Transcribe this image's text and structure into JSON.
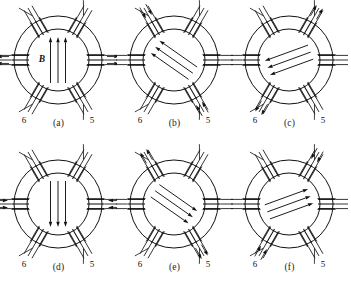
{
  "figure": {
    "background_color": "#ffffff",
    "line_color": "#111111",
    "panel_count": 6,
    "terminal_labels": [
      "1",
      "2",
      "3",
      "4",
      "5",
      "6"
    ],
    "field_label": "B"
  },
  "geometry": {
    "outer_radius": 44,
    "inner_radius": 31,
    "center_x": 58,
    "center_y": 60,
    "coil_angles_deg": [
      180,
      240,
      300,
      0,
      60,
      120
    ],
    "terminal_label_text": [
      "1",
      "2",
      "3",
      "4",
      "5",
      "6"
    ]
  },
  "panels": [
    {
      "id": "a",
      "caption": "(a)",
      "field_angle_deg": 270,
      "field_label": "B",
      "field_label_visible": true,
      "arrow_count": 3,
      "active_terminals": [
        "1",
        "4"
      ],
      "terminals": [
        {
          "label": "1",
          "angle_deg": 180,
          "lead_arrows": "out"
        },
        {
          "label": "2",
          "angle_deg": 240,
          "lead_arrows": "none"
        },
        {
          "label": "3",
          "angle_deg": 300,
          "lead_arrows": "none"
        },
        {
          "label": "4",
          "angle_deg": 0,
          "lead_arrows": "out"
        },
        {
          "label": "5",
          "angle_deg": 60,
          "lead_arrows": "none"
        },
        {
          "label": "6",
          "angle_deg": 120,
          "lead_arrows": "none"
        }
      ]
    },
    {
      "id": "b",
      "caption": "(b)",
      "field_angle_deg": 215,
      "field_label": "B",
      "field_label_visible": false,
      "arrow_count": 3,
      "active_terminals": [
        "2",
        "5"
      ],
      "terminals": [
        {
          "label": "1",
          "angle_deg": 180,
          "lead_arrows": "none"
        },
        {
          "label": "2",
          "angle_deg": 240,
          "lead_arrows": "in"
        },
        {
          "label": "3",
          "angle_deg": 300,
          "lead_arrows": "none"
        },
        {
          "label": "4",
          "angle_deg": 0,
          "lead_arrows": "none"
        },
        {
          "label": "5",
          "angle_deg": 60,
          "lead_arrows": "in"
        },
        {
          "label": "6",
          "angle_deg": 120,
          "lead_arrows": "none"
        }
      ]
    },
    {
      "id": "c",
      "caption": "(c)",
      "field_angle_deg": 160,
      "field_label": "B",
      "field_label_visible": false,
      "arrow_count": 3,
      "active_terminals": [
        "3",
        "6"
      ],
      "terminals": [
        {
          "label": "1",
          "angle_deg": 180,
          "lead_arrows": "none"
        },
        {
          "label": "2",
          "angle_deg": 240,
          "lead_arrows": "none"
        },
        {
          "label": "3",
          "angle_deg": 300,
          "lead_arrows": "out"
        },
        {
          "label": "4",
          "angle_deg": 0,
          "lead_arrows": "none"
        },
        {
          "label": "5",
          "angle_deg": 60,
          "lead_arrows": "none"
        },
        {
          "label": "6",
          "angle_deg": 120,
          "lead_arrows": "out"
        }
      ]
    },
    {
      "id": "d",
      "caption": "(d)",
      "field_angle_deg": 90,
      "field_label": "B",
      "field_label_visible": false,
      "arrow_count": 3,
      "active_terminals": [
        "1",
        "4"
      ],
      "terminals": [
        {
          "label": "1",
          "angle_deg": 180,
          "lead_arrows": "in"
        },
        {
          "label": "2",
          "angle_deg": 240,
          "lead_arrows": "none"
        },
        {
          "label": "3",
          "angle_deg": 300,
          "lead_arrows": "none"
        },
        {
          "label": "4",
          "angle_deg": 0,
          "lead_arrows": "in"
        },
        {
          "label": "5",
          "angle_deg": 60,
          "lead_arrows": "none"
        },
        {
          "label": "6",
          "angle_deg": 120,
          "lead_arrows": "none"
        }
      ]
    },
    {
      "id": "e",
      "caption": "(e)",
      "field_angle_deg": 35,
      "field_label": "B",
      "field_label_visible": false,
      "arrow_count": 3,
      "active_terminals": [
        "2",
        "5"
      ],
      "terminals": [
        {
          "label": "1",
          "angle_deg": 180,
          "lead_arrows": "none"
        },
        {
          "label": "2",
          "angle_deg": 240,
          "lead_arrows": "out"
        },
        {
          "label": "3",
          "angle_deg": 300,
          "lead_arrows": "none"
        },
        {
          "label": "4",
          "angle_deg": 0,
          "lead_arrows": "none"
        },
        {
          "label": "5",
          "angle_deg": 60,
          "lead_arrows": "out"
        },
        {
          "label": "6",
          "angle_deg": 120,
          "lead_arrows": "none"
        }
      ]
    },
    {
      "id": "f",
      "caption": "(f)",
      "field_angle_deg": 340,
      "field_label": "B",
      "field_label_visible": false,
      "arrow_count": 3,
      "active_terminals": [
        "3",
        "6"
      ],
      "terminals": [
        {
          "label": "1",
          "angle_deg": 180,
          "lead_arrows": "none"
        },
        {
          "label": "2",
          "angle_deg": 240,
          "lead_arrows": "none"
        },
        {
          "label": "3",
          "angle_deg": 300,
          "lead_arrows": "in"
        },
        {
          "label": "4",
          "angle_deg": 0,
          "lead_arrows": "none"
        },
        {
          "label": "5",
          "angle_deg": 60,
          "lead_arrows": "none"
        },
        {
          "label": "6",
          "angle_deg": 120,
          "lead_arrows": "in"
        }
      ]
    }
  ]
}
